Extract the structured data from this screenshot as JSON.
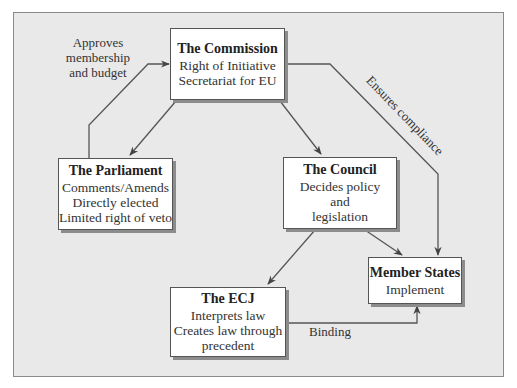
{
  "boxes": {
    "commission": {
      "title": "The Commission",
      "lines": [
        "Right of Initiative",
        "Secretariat for EU"
      ]
    },
    "parliament": {
      "title": "The Parliament",
      "lines": [
        "Comments/Amends",
        "Directly elected",
        "Limited right of veto"
      ]
    },
    "council": {
      "title": "The Council",
      "lines": [
        "Decides policy",
        "and",
        "legislation"
      ]
    },
    "ecj": {
      "title": "The ECJ",
      "lines": [
        "Interprets law",
        "Creates law through",
        "precedent"
      ]
    },
    "member_states": {
      "title": "Member States",
      "lines": [
        "Implement"
      ]
    }
  },
  "edge_labels": {
    "approves": [
      "Approves",
      "membership",
      "and budget"
    ],
    "ensures": "Ensures compliance",
    "binding": "Binding"
  },
  "edges": [
    {
      "from": "parliament",
      "to": "commission",
      "label": "approves"
    },
    {
      "from": "commission",
      "to": "parliament"
    },
    {
      "from": "commission",
      "to": "council"
    },
    {
      "from": "commission",
      "to": "member_states",
      "label": "ensures"
    },
    {
      "from": "council",
      "to": "ecj"
    },
    {
      "from": "council",
      "to": "member_states"
    },
    {
      "from": "ecj",
      "to": "member_states",
      "label": "binding"
    }
  ]
}
